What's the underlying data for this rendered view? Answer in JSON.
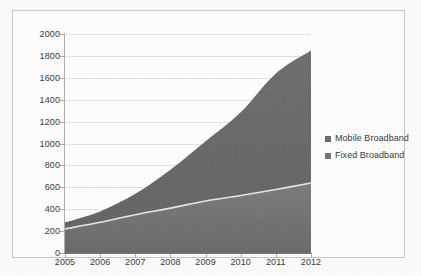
{
  "chart_data": {
    "type": "area",
    "stacked": true,
    "title": "",
    "subtitle": "",
    "xlabel": "",
    "ylabel": "",
    "categories": [
      "2005",
      "2006",
      "2007",
      "2008",
      "2009",
      "2010",
      "2011",
      "2012"
    ],
    "x": [
      2005,
      2006,
      2007,
      2008,
      2009,
      2010,
      2011,
      2012
    ],
    "series": [
      {
        "name": "Fixed Broadband",
        "color": "#767676",
        "values": [
          220,
          280,
          350,
          410,
          475,
          525,
          580,
          640
        ]
      },
      {
        "name": "Mobile Broadband",
        "color": "#6e6e6e",
        "values": [
          60,
          100,
          190,
          350,
          545,
          760,
          1060,
          1210
        ]
      }
    ],
    "stack_totals": [
      280,
      380,
      540,
      760,
      1020,
      1285,
      1640,
      1850
    ],
    "ylim": [
      0,
      2000
    ],
    "ytick_step": 200,
    "yticks": [
      "0",
      "200",
      "400",
      "600",
      "800",
      "1000",
      "1200",
      "1400",
      "1600",
      "1800",
      "2000"
    ],
    "grid": true,
    "grid_axis": "y",
    "legend_position": "right"
  },
  "legend": {
    "entries": [
      {
        "label": "Mobile Broadband",
        "color": "#6e6e6e",
        "marker": "square-swatch"
      },
      {
        "label": "Fixed Broadband",
        "color": "#767676",
        "marker": "square-swatch"
      }
    ]
  },
  "colors": {
    "plot_background": "#ffffff",
    "frame_border": "#c9c9c9",
    "gridline": "#e3e3e3",
    "axis": "#7d7d7d",
    "text": "#3c3c3c",
    "mobile_broadband": "#6e6e6e",
    "fixed_broadband": "#767676"
  }
}
